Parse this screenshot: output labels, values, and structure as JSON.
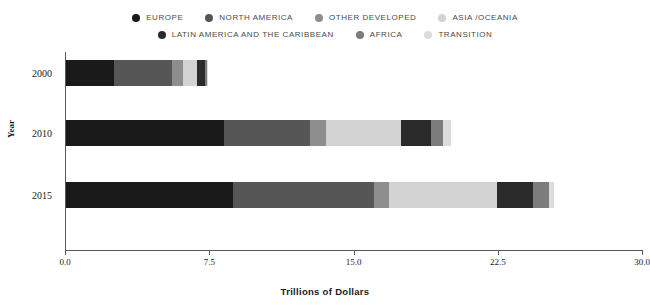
{
  "chart_data": {
    "type": "bar",
    "orientation": "horizontal",
    "stacked": true,
    "title": "",
    "xlabel": "Trillions of Dollars",
    "ylabel": "Year",
    "xlim": [
      0.0,
      30.0
    ],
    "xticks": [
      "0.0",
      "7.5",
      "15.0",
      "22.5",
      "30.0"
    ],
    "xtick_values": [
      0.0,
      7.5,
      15.0,
      22.5,
      30.0
    ],
    "grid": false,
    "legend_position": "top",
    "categories": [
      "2000",
      "2010",
      "2015"
    ],
    "series": [
      {
        "name": "EUROPE",
        "color": "#1a1a1a",
        "values": [
          2.5,
          8.2,
          8.7
        ]
      },
      {
        "name": "NORTH AMERICA",
        "color": "#565656",
        "values": [
          3.0,
          4.5,
          7.3
        ]
      },
      {
        "name": "OTHER DEVELOPED",
        "color": "#8e8e8e",
        "values": [
          0.6,
          0.8,
          0.8
        ]
      },
      {
        "name": "ASIA /OCEANIA",
        "color": "#d2d2d2",
        "values": [
          0.7,
          3.9,
          5.6
        ]
      },
      {
        "name": "LATIN AMERICA AND THE CARIBBEAN",
        "color": "#2a2a2a",
        "values": [
          0.45,
          1.6,
          1.9
        ]
      },
      {
        "name": "AFRICA",
        "color": "#7c7c7c",
        "values": [
          0.1,
          0.6,
          0.8
        ]
      },
      {
        "name": "TRANSITION",
        "color": "#dcdcdc",
        "values": [
          0.05,
          0.4,
          0.3
        ]
      }
    ],
    "totals": [
      7.4,
      20.0,
      25.4
    ]
  },
  "legend": {
    "row1": [
      {
        "label": "EUROPE",
        "color": "#1a1a1a"
      },
      {
        "label": "NORTH AMERICA",
        "color": "#565656"
      },
      {
        "label": "OTHER DEVELOPED",
        "color": "#8e8e8e"
      },
      {
        "label": "ASIA /OCEANIA",
        "color": "#d2d2d2"
      }
    ],
    "row2": [
      {
        "label": "LATIN AMERICA AND THE CARIBBEAN",
        "color": "#2a2a2a"
      },
      {
        "label": "AFRICA",
        "color": "#7c7c7c"
      },
      {
        "label": "TRANSITION",
        "color": "#dcdcdc"
      }
    ]
  },
  "axes": {
    "y_title": "Year",
    "x_title": "Trillions of Dollars"
  }
}
